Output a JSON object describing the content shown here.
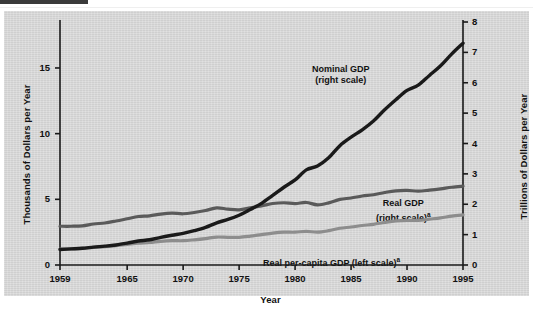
{
  "figure": {
    "background_color": "#d6d6d6",
    "page_background": "#ffffff",
    "top_rule_color": "#3a3a3a"
  },
  "axes": {
    "left_title": "Thousands of Dollars per Year",
    "right_title": "Trillions of Dollars per Year",
    "x_title": "Year",
    "left_ticks": [
      "0",
      "5",
      "10",
      "15"
    ],
    "right_ticks": [
      "0",
      "1",
      "2",
      "3",
      "4",
      "5",
      "6",
      "7",
      "8"
    ],
    "x_ticks": [
      "1959",
      "1965",
      "1970",
      "1975",
      "1980",
      "1985",
      "1990",
      "1995"
    ]
  },
  "annotations": {
    "nominal_line1": "Nominal GDP",
    "nominal_line2": "(right scale)",
    "real_line1": "Real GDP",
    "real_line2": "(right scale)",
    "real_sup": "a",
    "percapita": "Real per-capita GDP (left scale)",
    "percapita_sup": "a"
  },
  "colors": {
    "nominal_gdp": "#1a1a1a",
    "real_gdp": "#8d8d8d",
    "real_per_capita": "#5a5a5a",
    "axis": "#1a1a1a"
  },
  "chart_data": {
    "type": "line",
    "title": "",
    "xlabel": "Year",
    "ylabel": "Thousands of Dollars per Year",
    "y2label": "Trillions of Dollars per Year",
    "grid": false,
    "legend": "inline-annotations",
    "xlim": [
      1959,
      1995
    ],
    "ylim": [
      0,
      18.5
    ],
    "y2lim": [
      0,
      8
    ],
    "x": [
      1959,
      1960,
      1961,
      1962,
      1963,
      1964,
      1965,
      1966,
      1967,
      1968,
      1969,
      1970,
      1971,
      1972,
      1973,
      1974,
      1975,
      1976,
      1977,
      1978,
      1979,
      1980,
      1981,
      1982,
      1983,
      1984,
      1985,
      1986,
      1987,
      1988,
      1989,
      1990,
      1991,
      1992,
      1993,
      1994,
      1995
    ],
    "series": [
      {
        "name": "Nominal GDP (right scale)",
        "axis": "right",
        "units": "Trillions of Dollars per Year",
        "color": "#1a1a1a",
        "values": [
          0.51,
          0.53,
          0.55,
          0.59,
          0.62,
          0.66,
          0.72,
          0.79,
          0.83,
          0.91,
          0.98,
          1.04,
          1.13,
          1.24,
          1.39,
          1.5,
          1.64,
          1.83,
          2.03,
          2.29,
          2.56,
          2.8,
          3.13,
          3.26,
          3.53,
          3.93,
          4.21,
          4.45,
          4.74,
          5.11,
          5.44,
          5.75,
          5.92,
          6.24,
          6.56,
          6.95,
          7.3
        ]
      },
      {
        "name": "Real GDP (right scale)",
        "axis": "right",
        "units": "Trillions of Dollars per Year",
        "color": "#8d8d8d",
        "values": [
          0.52,
          0.53,
          0.55,
          0.58,
          0.6,
          0.64,
          0.68,
          0.72,
          0.74,
          0.78,
          0.8,
          0.8,
          0.83,
          0.87,
          0.92,
          0.91,
          0.91,
          0.95,
          1.0,
          1.05,
          1.08,
          1.08,
          1.11,
          1.08,
          1.13,
          1.21,
          1.25,
          1.3,
          1.34,
          1.4,
          1.45,
          1.47,
          1.47,
          1.51,
          1.55,
          1.61,
          1.65
        ]
      },
      {
        "name": "Real per-capita GDP (left scale)",
        "axis": "left",
        "units": "Thousands of Dollars per Year",
        "color": "#5a5a5a",
        "values": [
          2.95,
          2.95,
          2.98,
          3.12,
          3.2,
          3.35,
          3.52,
          3.69,
          3.74,
          3.88,
          3.95,
          3.9,
          4.0,
          4.15,
          4.35,
          4.25,
          4.2,
          4.35,
          4.5,
          4.68,
          4.74,
          4.68,
          4.76,
          4.58,
          4.73,
          5.0,
          5.1,
          5.25,
          5.35,
          5.52,
          5.65,
          5.68,
          5.62,
          5.7,
          5.8,
          5.92,
          6.0
        ]
      }
    ]
  }
}
